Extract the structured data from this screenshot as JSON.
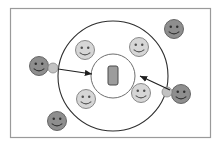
{
  "figure": {
    "title": "",
    "canvas": {
      "width": 220,
      "height": 146,
      "background": "#ffffff"
    },
    "frame": {
      "name": "diagram-frame",
      "x": 10.5,
      "y": 8.5,
      "width": 200,
      "height": 129,
      "stroke": "#9a9a9a",
      "stroke_width": 1.2,
      "fill": "#ffffff"
    },
    "colors": {
      "outline": "#3a3a3a",
      "circle_stroke": "#2e2e2e",
      "light_face_fill": "#d6d6d6",
      "light_face_stroke": "#7d7d7d",
      "dark_face_fill": "#8e8e8e",
      "dark_face_stroke": "#5a5a5a",
      "satellite_fill": "#c2c2c2",
      "satellite_stroke": "#8a8a8a",
      "device_fill": "#9c9c9c",
      "device_stroke": "#4a4a4a",
      "arrow": "#1f1f1f",
      "frame": "#9a9a9a"
    },
    "outer_circle": {
      "name": "outer-ring-circle",
      "cx": 113,
      "cy": 76,
      "r": 55,
      "stroke": "#2e2e2e",
      "stroke_width": 1.1,
      "fill": "none",
      "label": ""
    },
    "inner_circle": {
      "name": "inner-ring-circle",
      "cx": 113,
      "cy": 76,
      "r": 22,
      "stroke": "#6e6e6e",
      "stroke_width": 1.0,
      "fill": "none",
      "label": ""
    },
    "center_device": {
      "name": "center-device-rect",
      "x": 108,
      "y": 66,
      "width": 10,
      "height": 19,
      "rx": 2,
      "fill": "#9c9c9c",
      "stroke": "#4a4a4a",
      "label": ""
    },
    "inner_faces": [
      {
        "name": "inner-smiley-top-left",
        "cx": 85,
        "cy": 50,
        "r": 9.5,
        "tone": "light",
        "label": ""
      },
      {
        "name": "inner-smiley-top-right",
        "cx": 139,
        "cy": 47,
        "r": 9.5,
        "tone": "light",
        "label": ""
      },
      {
        "name": "inner-smiley-bottom-left",
        "cx": 86,
        "cy": 99,
        "r": 9.5,
        "tone": "light",
        "label": ""
      },
      {
        "name": "inner-smiley-bottom-right",
        "cx": 141,
        "cy": 93,
        "r": 9.5,
        "tone": "light",
        "label": ""
      }
    ],
    "outer_faces": [
      {
        "name": "outer-smiley-top-right",
        "cx": 174,
        "cy": 29,
        "r": 9.5,
        "tone": "dark",
        "label": ""
      },
      {
        "name": "outer-smiley-bottom-left",
        "cx": 57,
        "cy": 121,
        "r": 9.5,
        "tone": "dark",
        "label": ""
      },
      {
        "name": "outer-smiley-left",
        "cx": 39,
        "cy": 66,
        "r": 9.5,
        "tone": "dark",
        "label": ""
      },
      {
        "name": "outer-smiley-right",
        "cx": 181,
        "cy": 94,
        "r": 9.5,
        "tone": "dark",
        "label": ""
      }
    ],
    "satellites": [
      {
        "name": "satellite-dot-left",
        "cx": 53,
        "cy": 68,
        "r": 5.0
      },
      {
        "name": "satellite-dot-right",
        "cx": 167,
        "cy": 92,
        "r": 5.0
      }
    ],
    "arrows": [
      {
        "name": "arrow-inbound-left",
        "x1": 58,
        "y1": 69,
        "x2": 92,
        "y2": 74,
        "stroke": "#1f1f1f",
        "stroke_width": 1.2,
        "label": ""
      },
      {
        "name": "arrow-inbound-right",
        "x1": 170,
        "y1": 90,
        "x2": 140,
        "y2": 76,
        "stroke": "#1f1f1f",
        "stroke_width": 1.2,
        "label": ""
      }
    ],
    "annotations": []
  }
}
